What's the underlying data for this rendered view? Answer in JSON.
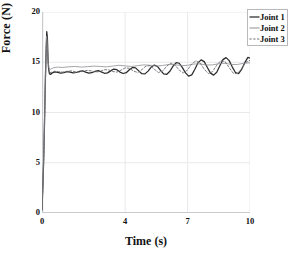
{
  "chart_data": {
    "type": "line",
    "title": "",
    "xlabel": "Time (s)",
    "ylabel": "Force (N)",
    "xlim": [
      0,
      10
    ],
    "ylim": [
      0,
      20
    ],
    "xticks": [
      0,
      4,
      7,
      10
    ],
    "yticks": [
      0,
      5,
      10,
      15,
      20
    ],
    "xtick_labels": [
      "0",
      "4",
      "7",
      "10"
    ],
    "ytick_labels": [
      "0",
      "5",
      "10",
      "15",
      "20"
    ],
    "grid": true,
    "legend_position": "top-right",
    "series": [
      {
        "name": "Joint 1",
        "style": "solid",
        "color": "#2b2b2b",
        "width": 1.25,
        "points": [
          [
            0.0,
            0.3
          ],
          [
            0.04,
            2.6
          ],
          [
            0.08,
            5.2
          ],
          [
            0.12,
            9.0
          ],
          [
            0.16,
            13.2
          ],
          [
            0.2,
            16.4
          ],
          [
            0.23,
            18.05
          ],
          [
            0.26,
            17.4
          ],
          [
            0.29,
            15.4
          ],
          [
            0.32,
            14.3
          ],
          [
            0.36,
            13.85
          ],
          [
            0.42,
            13.8
          ],
          [
            0.5,
            13.95
          ],
          [
            0.62,
            14.05
          ],
          [
            0.75,
            14.0
          ],
          [
            0.9,
            13.92
          ],
          [
            1.05,
            13.96
          ],
          [
            1.2,
            14.06
          ],
          [
            1.35,
            14.02
          ],
          [
            1.5,
            13.94
          ],
          [
            1.65,
            13.98
          ],
          [
            1.8,
            14.1
          ],
          [
            1.95,
            14.14
          ],
          [
            2.1,
            14.02
          ],
          [
            2.25,
            13.92
          ],
          [
            2.4,
            13.96
          ],
          [
            2.55,
            14.1
          ],
          [
            2.7,
            14.16
          ],
          [
            2.85,
            14.04
          ],
          [
            3.0,
            13.9
          ],
          [
            3.15,
            13.94
          ],
          [
            3.3,
            14.14
          ],
          [
            3.45,
            14.32
          ],
          [
            3.6,
            14.26
          ],
          [
            3.75,
            14.02
          ],
          [
            3.9,
            13.88
          ],
          [
            4.05,
            13.96
          ],
          [
            4.2,
            14.26
          ],
          [
            4.35,
            14.48
          ],
          [
            4.5,
            14.44
          ],
          [
            4.65,
            14.14
          ],
          [
            4.8,
            13.86
          ],
          [
            4.95,
            13.84
          ],
          [
            5.1,
            14.12
          ],
          [
            5.25,
            14.52
          ],
          [
            5.4,
            14.72
          ],
          [
            5.55,
            14.58
          ],
          [
            5.7,
            14.18
          ],
          [
            5.85,
            13.84
          ],
          [
            6.0,
            13.8
          ],
          [
            6.15,
            14.1
          ],
          [
            6.3,
            14.62
          ],
          [
            6.45,
            14.96
          ],
          [
            6.6,
            14.9
          ],
          [
            6.75,
            14.46
          ],
          [
            6.9,
            13.94
          ],
          [
            7.05,
            13.62
          ],
          [
            7.2,
            13.74
          ],
          [
            7.35,
            14.3
          ],
          [
            7.5,
            14.94
          ],
          [
            7.65,
            15.24
          ],
          [
            7.8,
            15.06
          ],
          [
            7.95,
            14.48
          ],
          [
            8.1,
            13.92
          ],
          [
            8.25,
            13.72
          ],
          [
            8.4,
            14.0
          ],
          [
            8.55,
            14.66
          ],
          [
            8.7,
            15.26
          ],
          [
            8.85,
            15.46
          ],
          [
            9.0,
            15.16
          ],
          [
            9.15,
            14.52
          ],
          [
            9.3,
            13.98
          ],
          [
            9.45,
            13.88
          ],
          [
            9.6,
            14.3
          ],
          [
            9.75,
            14.96
          ],
          [
            9.9,
            15.48
          ],
          [
            10.0,
            15.42
          ]
        ]
      },
      {
        "name": "Joint 2",
        "style": "solid",
        "color": "#8e8e93",
        "width": 0.8,
        "points": [
          [
            0.0,
            0.35
          ],
          [
            0.05,
            3.4
          ],
          [
            0.1,
            7.4
          ],
          [
            0.15,
            12.1
          ],
          [
            0.19,
            15.6
          ],
          [
            0.22,
            17.6
          ],
          [
            0.25,
            17.1
          ],
          [
            0.29,
            15.3
          ],
          [
            0.33,
            14.4
          ],
          [
            0.4,
            14.3
          ],
          [
            0.55,
            14.45
          ],
          [
            0.75,
            14.52
          ],
          [
            1.0,
            14.48
          ],
          [
            1.3,
            14.55
          ],
          [
            1.6,
            14.58
          ],
          [
            1.9,
            14.52
          ],
          [
            2.2,
            14.56
          ],
          [
            2.5,
            14.62
          ],
          [
            2.8,
            14.58
          ],
          [
            3.1,
            14.54
          ],
          [
            3.4,
            14.62
          ],
          [
            3.7,
            14.7
          ],
          [
            4.0,
            14.64
          ],
          [
            4.3,
            14.58
          ],
          [
            4.6,
            14.66
          ],
          [
            4.9,
            14.74
          ],
          [
            5.2,
            14.7
          ],
          [
            5.5,
            14.62
          ],
          [
            5.8,
            14.68
          ],
          [
            6.1,
            14.78
          ],
          [
            6.4,
            14.76
          ],
          [
            6.7,
            14.66
          ],
          [
            7.0,
            14.7
          ],
          [
            7.3,
            14.82
          ],
          [
            7.6,
            14.84
          ],
          [
            7.9,
            14.72
          ],
          [
            8.2,
            14.74
          ],
          [
            8.5,
            14.86
          ],
          [
            8.8,
            14.9
          ],
          [
            9.1,
            14.78
          ],
          [
            9.4,
            14.78
          ],
          [
            9.7,
            14.9
          ],
          [
            10.0,
            14.94
          ]
        ]
      },
      {
        "name": "Joint 3",
        "style": "dashed",
        "color": "#6e6e73",
        "width": 0.9,
        "points": [
          [
            0.0,
            0.4
          ],
          [
            0.05,
            3.0
          ],
          [
            0.1,
            6.6
          ],
          [
            0.15,
            11.2
          ],
          [
            0.19,
            14.8
          ],
          [
            0.22,
            16.9
          ],
          [
            0.26,
            16.2
          ],
          [
            0.3,
            14.6
          ],
          [
            0.36,
            13.95
          ],
          [
            0.45,
            14.0
          ],
          [
            0.6,
            14.1
          ],
          [
            0.8,
            14.06
          ],
          [
            1.0,
            14.02
          ],
          [
            1.2,
            14.1
          ],
          [
            1.4,
            14.14
          ],
          [
            1.6,
            14.06
          ],
          [
            1.8,
            14.02
          ],
          [
            2.0,
            14.12
          ],
          [
            2.2,
            14.2
          ],
          [
            2.4,
            14.12
          ],
          [
            2.6,
            14.02
          ],
          [
            2.8,
            14.1
          ],
          [
            3.0,
            14.26
          ],
          [
            3.2,
            14.24
          ],
          [
            3.4,
            14.08
          ],
          [
            3.6,
            14.02
          ],
          [
            3.8,
            14.22
          ],
          [
            4.0,
            14.44
          ],
          [
            4.2,
            14.4
          ],
          [
            4.4,
            14.12
          ],
          [
            4.6,
            13.98
          ],
          [
            4.8,
            14.26
          ],
          [
            5.0,
            14.62
          ],
          [
            5.2,
            14.66
          ],
          [
            5.4,
            14.3
          ],
          [
            5.6,
            13.98
          ],
          [
            5.8,
            14.12
          ],
          [
            6.0,
            14.62
          ],
          [
            6.2,
            14.92
          ],
          [
            6.4,
            14.72
          ],
          [
            6.6,
            14.2
          ],
          [
            6.8,
            13.94
          ],
          [
            7.0,
            14.24
          ],
          [
            7.2,
            14.84
          ],
          [
            7.4,
            15.14
          ],
          [
            7.6,
            14.92
          ],
          [
            7.8,
            14.3
          ],
          [
            8.0,
            13.88
          ],
          [
            8.2,
            14.06
          ],
          [
            8.4,
            14.72
          ],
          [
            8.6,
            15.16
          ],
          [
            8.8,
            15.06
          ],
          [
            9.0,
            14.46
          ],
          [
            9.2,
            13.9
          ],
          [
            9.4,
            13.86
          ],
          [
            9.6,
            14.4
          ],
          [
            9.8,
            15.0
          ],
          [
            10.0,
            15.18
          ]
        ]
      }
    ]
  },
  "axes": {
    "x_title": "Time (s)",
    "y_title": "Force (N)"
  },
  "legend": {
    "items": [
      {
        "label": "Joint 1"
      },
      {
        "label": "Joint 2"
      },
      {
        "label": "Joint 3"
      }
    ]
  },
  "colors": {
    "grid": "#e9e9ec",
    "axis": "#c9c9ce",
    "text": "#111111",
    "legend_border": "#b9b9bd"
  }
}
